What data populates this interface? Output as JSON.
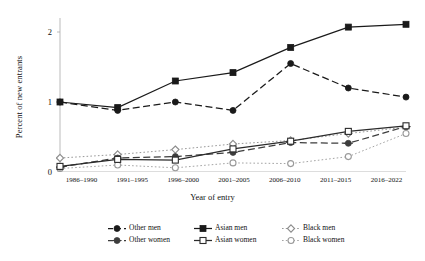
{
  "chart_data": {
    "type": "line",
    "title": "",
    "xlabel": "Year of entry",
    "ylabel": "Percent of new entrants",
    "categories": [
      "1986–1990",
      "1991–1995",
      "1996–2000",
      "2001–2005",
      "2006–2010",
      "2011–2015",
      "2016–2022"
    ],
    "ylim": [
      0,
      2.2
    ],
    "yticks": [
      0,
      1,
      2
    ],
    "ytick_labels": [
      "0",
      "1",
      "2"
    ],
    "grid": false,
    "legend_position": "bottom",
    "series": [
      {
        "name": "Other men",
        "marker": "filled-circle",
        "line": "dashed",
        "color": "#1a1a1a",
        "values": [
          1.0,
          0.88,
          1.0,
          0.88,
          1.55,
          1.2,
          1.07
        ]
      },
      {
        "name": "Asian men",
        "marker": "filled-square",
        "line": "solid",
        "color": "#1a1a1a",
        "values": [
          1.0,
          0.92,
          1.3,
          1.42,
          1.78,
          2.07,
          2.11
        ]
      },
      {
        "name": "Black men",
        "marker": "open-diamond",
        "line": "dotted",
        "color": "#8c8c8c",
        "values": [
          0.2,
          0.25,
          0.32,
          0.4,
          0.45,
          0.55,
          0.64
        ]
      },
      {
        "name": "Other women",
        "marker": "circle-dash",
        "line": "dashed",
        "color": "#3d3d3d",
        "values": [
          0.07,
          0.2,
          0.22,
          0.28,
          0.42,
          0.41,
          0.65
        ]
      },
      {
        "name": "Asian women",
        "marker": "open-square",
        "line": "solid",
        "color": "#2b2b2b",
        "values": [
          0.08,
          0.18,
          0.17,
          0.33,
          0.44,
          0.58,
          0.66
        ]
      },
      {
        "name": "Black women",
        "marker": "open-circle",
        "line": "dotted",
        "color": "#9a9a9a",
        "values": [
          0.05,
          0.1,
          0.06,
          0.13,
          0.12,
          0.22,
          0.55
        ]
      }
    ]
  },
  "axes": {
    "ylabel": "Percent of new entrants",
    "xlabel": "Year of entry",
    "ytick_labels": [
      "0",
      "1",
      "2"
    ],
    "xtick_labels": [
      "1986–1990",
      "1991–1995",
      "1996–2000",
      "2001–2005",
      "2006–2010",
      "2011–2015",
      "2016–2022"
    ]
  },
  "legend": {
    "items": [
      {
        "label": "Other men"
      },
      {
        "label": "Asian men"
      },
      {
        "label": "Black men"
      },
      {
        "label": "Other women"
      },
      {
        "label": "Asian women"
      },
      {
        "label": "Black women"
      }
    ]
  }
}
